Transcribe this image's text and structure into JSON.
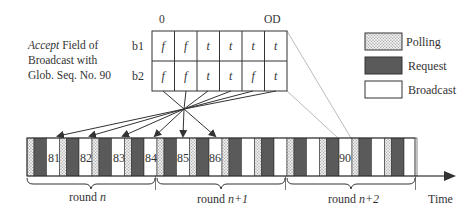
{
  "caption": {
    "italic": "Accept",
    "line1_rest": " Field of",
    "line2": "Broadcast with",
    "line3": "Glob. Seq. No. 90"
  },
  "table": {
    "col_labels": {
      "first": "0",
      "last": "OD"
    },
    "rows": [
      {
        "label": "b1",
        "cells": [
          "f",
          "f",
          "t",
          "t",
          "t",
          "t"
        ]
      },
      {
        "label": "b2",
        "cells": [
          "f",
          "f",
          "t",
          "t",
          "f",
          "t"
        ]
      }
    ]
  },
  "legend": {
    "items": [
      {
        "label": "Polling",
        "type": "polling"
      },
      {
        "label": "Request",
        "type": "request"
      },
      {
        "label": "Broadcast",
        "type": "broadcast"
      }
    ]
  },
  "timeline": {
    "axis_label": "Time",
    "rounds": [
      {
        "prefix": "round ",
        "var": "n"
      },
      {
        "prefix": "round ",
        "var": "n+1"
      },
      {
        "prefix": "round ",
        "var": "n+2"
      }
    ],
    "broadcast_labels": [
      {
        "text": "81"
      },
      {
        "text": "82"
      },
      {
        "text": "83"
      },
      {
        "text": "84"
      },
      {
        "text": "85"
      },
      {
        "text": "86"
      },
      {
        "text": "90"
      }
    ]
  },
  "colors": {
    "request": "#5a5a5a",
    "polling_bg": "#e8e8e8",
    "polling_dot": "#777777",
    "broadcast": "#ffffff",
    "stroke": "#333333",
    "guide_line": "#999999"
  }
}
